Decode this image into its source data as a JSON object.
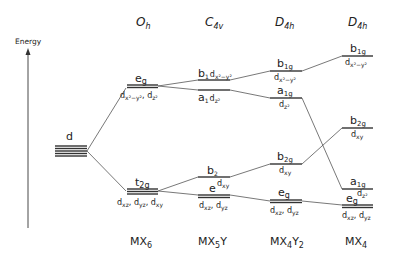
{
  "axis": {
    "label": "Energy"
  },
  "columns": [
    {
      "group": "",
      "compound": "",
      "levels": [
        {
          "symbol": "d",
          "orbitals": ""
        }
      ]
    },
    {
      "group": "O",
      "group_sub": "h",
      "compound": "MX",
      "compound_sub": "6",
      "levels": [
        {
          "symbol": "e",
          "sub": "g",
          "orbitals": "dx²−y², dz²"
        },
        {
          "symbol": "t",
          "sub": "2g",
          "orbitals": "dxz, dyz, dxy"
        }
      ]
    },
    {
      "group": "C",
      "group_sub": "4v",
      "compound": "MX",
      "compound_sub": "5",
      "compound_tail": "Y",
      "levels": [
        {
          "symbol": "b",
          "sub": "1",
          "orbitals": "dx²−y²"
        },
        {
          "symbol": "a",
          "sub": "1",
          "orbitals": "dz²"
        },
        {
          "symbol": "b",
          "sub": "2",
          "orbitals": "dxy"
        },
        {
          "symbol": "e",
          "sub": "",
          "orbitals": "dxz, dyz"
        }
      ]
    },
    {
      "group": "D",
      "group_sub": "4h",
      "compound": "MX",
      "compound_sub": "4",
      "compound_tail": "Y",
      "compound_tail_sub": "2",
      "levels": [
        {
          "symbol": "b",
          "sub": "1g",
          "orbitals": "dx²−y²"
        },
        {
          "symbol": "a",
          "sub": "1g",
          "orbitals": "dz²"
        },
        {
          "symbol": "b",
          "sub": "2g",
          "orbitals": "dxy"
        },
        {
          "symbol": "e",
          "sub": "g",
          "orbitals": "dxz, dyz"
        }
      ]
    },
    {
      "group": "D",
      "group_sub": "4h",
      "compound": "MX",
      "compound_sub": "4",
      "levels": [
        {
          "symbol": "b",
          "sub": "1g",
          "orbitals": "dx²−y²"
        },
        {
          "symbol": "b",
          "sub": "2g",
          "orbitals": "dxy"
        },
        {
          "symbol": "a",
          "sub": "1g",
          "orbitals": "dz²"
        },
        {
          "symbol": "e",
          "sub": "g",
          "orbitals": "dxz, dyz"
        }
      ]
    }
  ],
  "text": {
    "energy": "Energy",
    "d": "d",
    "oh_g": "O",
    "oh_s": "h",
    "c4v_g": "C",
    "c4v_s": "4v",
    "d4h_g": "D",
    "d4h_s": "4h",
    "eg_e": "e",
    "eg_g": "g",
    "t2g_t": "t",
    "t2g_s": "2g",
    "b": "b",
    "a": "a",
    "e": "e",
    "s1": "1",
    "s2": "2",
    "s1g": "1g",
    "s2g": "2g",
    "sg": "g",
    "d_": "d",
    "x2y2": "x²−y²",
    "z2": "z²",
    "xy": "xy",
    "xz": "xz",
    "yz": "yz",
    "comma": ", ",
    "mx": "MX",
    "y": "Y",
    "n6": "6",
    "n5": "5",
    "n4": "4",
    "n2": "2"
  }
}
